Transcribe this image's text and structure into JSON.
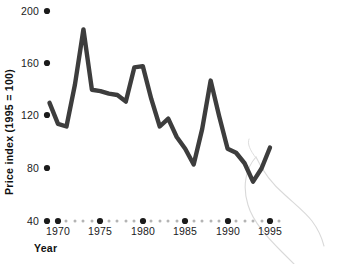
{
  "chart_data": {
    "type": "line",
    "title": "",
    "xlabel": "Year",
    "ylabel": "Price index (1995 = 100)",
    "xlim": [
      1968,
      1996
    ],
    "ylim": [
      40,
      200
    ],
    "grid": false,
    "legend": null,
    "x_ticks": [
      "1970",
      "1975",
      "1980",
      "1985",
      "1990",
      "1995"
    ],
    "x_tick_values": [
      1970,
      1975,
      1980,
      1985,
      1990,
      1995
    ],
    "y_ticks": [
      "40",
      "80",
      "120",
      "160",
      "200"
    ],
    "y_tick_values": [
      40,
      80,
      120,
      160,
      200
    ],
    "x_minor_values": [
      1969,
      1971,
      1972,
      1973,
      1974,
      1976,
      1977,
      1978,
      1979,
      1981,
      1982,
      1983,
      1984,
      1986,
      1987,
      1988,
      1989,
      1991,
      1992,
      1993,
      1994,
      1996
    ],
    "series": [
      {
        "name": "Price index",
        "color": "#3d3d3d",
        "x": [
          1969,
          1970,
          1971,
          1972,
          1973,
          1974,
          1975,
          1976,
          1977,
          1978,
          1979,
          1980,
          1981,
          1982,
          1983,
          1984,
          1985,
          1986,
          1987,
          1988,
          1989,
          1990,
          1991,
          1992,
          1993,
          1994,
          1995
        ],
        "values": [
          130,
          114,
          112,
          144,
          186,
          140,
          139,
          137,
          136,
          131,
          157,
          158,
          133,
          112,
          118,
          104,
          95,
          83,
          110,
          147,
          120,
          95,
          92,
          84,
          70,
          80,
          96
        ]
      }
    ],
    "annotations": [
      {
        "name": "faint-loop-scribble",
        "color": "#d6d6d6",
        "description": "faint light-grey looping pen curve overlapping lower right of plot"
      }
    ]
  },
  "axis_markers": {
    "major_dot_color": "#1b1b1b",
    "minor_dot_color": "#b4b4b4"
  }
}
